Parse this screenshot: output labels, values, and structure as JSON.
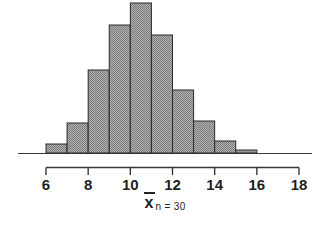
{
  "chart_data": {
    "type": "bar",
    "title": "",
    "subtitle": "",
    "xlabel": "x̄",
    "ylabel": "",
    "grid": false,
    "legend": null,
    "xlim": [
      5,
      19
    ],
    "ylim": [
      0,
      155
    ],
    "bin_width": 1,
    "axis_ticks": [
      6,
      8,
      10,
      12,
      14,
      16,
      18
    ],
    "tick_labels": [
      "6",
      "8",
      "10",
      "12",
      "14",
      "16",
      "18"
    ],
    "categories": [
      "6-7",
      "7-8",
      "8-9",
      "9-10",
      "10-11",
      "11-12",
      "12-13",
      "13-14",
      "14-15",
      "15-16"
    ],
    "bin_starts": [
      6,
      7,
      8,
      9,
      10,
      11,
      12,
      13,
      14,
      15
    ],
    "values": [
      9,
      30,
      83,
      128,
      150,
      118,
      63,
      32,
      12,
      3
    ],
    "annotations": [
      "n = 30"
    ],
    "bar_fill": "#9a9a9a",
    "bar_stroke": "#2a2a2a",
    "axis_color": "#2a2a2a"
  },
  "caption": {
    "symbol": "x",
    "overbar": true,
    "subscript": "n = 30"
  },
  "icons": {
    "overline": "overbar-icon"
  }
}
